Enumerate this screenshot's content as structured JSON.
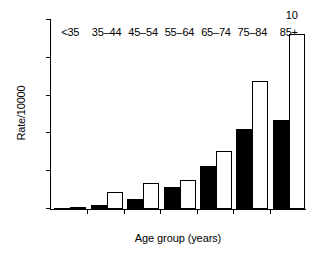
{
  "chart_data": {
    "type": "bar",
    "title": "",
    "xlabel": "Age group (years)",
    "ylabel": "Rate/10000",
    "categories": [
      "<35",
      "35–44",
      "45–54",
      "55–64",
      "65–74",
      "75–84",
      "85+"
    ],
    "series": [
      {
        "name": "solid",
        "style": "filled-black",
        "values": [
          0.05,
          0.2,
          0.53,
          1.18,
          2.3,
          4.26,
          4.72
        ]
      },
      {
        "name": "open",
        "style": "white-outline",
        "values": [
          0.12,
          0.9,
          1.37,
          1.55,
          3.05,
          6.75,
          9.25
        ]
      }
    ],
    "ylim": [
      0,
      10
    ],
    "yticks": [
      0,
      2,
      4,
      6,
      8,
      10
    ],
    "ytick_labels": [
      "0",
      "2",
      "4",
      "6",
      "8",
      "10"
    ],
    "grid": false,
    "legend": "none"
  }
}
